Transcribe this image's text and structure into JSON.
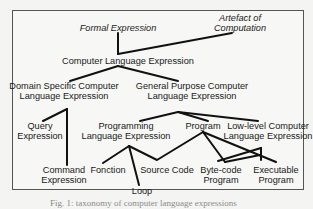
{
  "diagram": {
    "nodes": {
      "formal_expression": {
        "label": "Formal Expression"
      },
      "artefact_line1": {
        "label": "Artefact of"
      },
      "artefact_line2": {
        "label": "Computation"
      },
      "computer_language_expression": {
        "label": "Computer Language Expression"
      },
      "domain_specific_line1": {
        "label": "Domain Specific Computer"
      },
      "domain_specific_line2": {
        "label": "Language Expression"
      },
      "general_purpose_line1": {
        "label": "General Purpose Computer"
      },
      "general_purpose_line2": {
        "label": "Language Expression"
      },
      "query_line1": {
        "label": "Query"
      },
      "query_line2": {
        "label": "Expression"
      },
      "programming_line1": {
        "label": "Programming"
      },
      "programming_line2": {
        "label": "Language Expression"
      },
      "program": {
        "label": "Program"
      },
      "low_level_line1": {
        "label": "Low-level Computer"
      },
      "low_level_line2": {
        "label": "Language Expression"
      },
      "command_line1": {
        "label": "Command"
      },
      "command_line2": {
        "label": "Expression"
      },
      "fonction": {
        "label": "Fonction"
      },
      "loop": {
        "label": "Loop"
      },
      "source_code": {
        "label": "Source Code"
      },
      "bytecode_line1": {
        "label": "Byte-code"
      },
      "bytecode_line2": {
        "label": "Program"
      },
      "executable_line1": {
        "label": "Executable"
      },
      "executable_line2": {
        "label": "Program"
      }
    },
    "caption": "Fig. 1: taxonomy of computer language expressions"
  }
}
